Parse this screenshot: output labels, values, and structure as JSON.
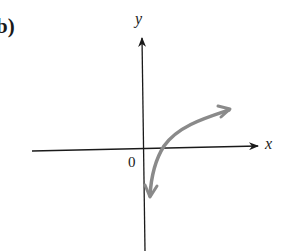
{
  "figure": {
    "part_label": "b)",
    "x_axis_label": "x",
    "y_axis_label": "y",
    "origin_label": "0"
  },
  "colors": {
    "axis": "#1a1a1a",
    "curve": "#8a8a8a",
    "background": "#ffffff"
  },
  "curve": {
    "description": "logarithmic-shaped curve with arrowheads at both ends, crossing positive x-axis just right of origin",
    "lower_end": "approaches negative y near y-axis",
    "upper_end": "rises slowly to upper right"
  }
}
